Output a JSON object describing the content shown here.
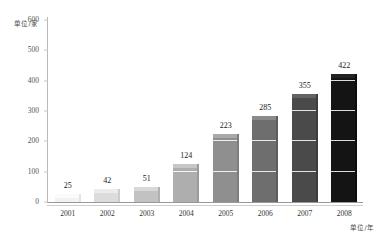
{
  "chart_data": {
    "type": "bar",
    "title": "",
    "subtitle": "",
    "xlabel": "单位/年",
    "ylabel": "单位/家",
    "categories": [
      "2001",
      "2002",
      "2003",
      "2004",
      "2005",
      "2006",
      "2007",
      "2008"
    ],
    "values": [
      25,
      42,
      51,
      124,
      223,
      285,
      355,
      422
    ],
    "value_labels": [
      "25",
      "42",
      "51",
      "124",
      "223",
      "285",
      "355",
      "422"
    ],
    "ylim": [
      0,
      600
    ],
    "yticks": [
      0,
      100,
      200,
      300,
      400,
      500,
      600
    ],
    "ytick_labels": [
      "0",
      "100",
      "200",
      "300",
      "400",
      "500",
      "600"
    ],
    "grid": false,
    "legend": false,
    "legend_position": "none",
    "style": "3d-stacked-blocks",
    "bar_colors": [
      "#f2f2f2",
      "#dcdcdc",
      "#c2c2c2",
      "#aeaeae",
      "#8f8f8f",
      "#6e6e6e",
      "#4a4a4a",
      "#141414"
    ],
    "bar_top_colors": [
      "#fbfbfb",
      "#ececec",
      "#d8d8d8",
      "#c6c6c6",
      "#a9a9a9",
      "#8a8a8a",
      "#636363",
      "#232323"
    ],
    "bar_side_colors": [
      "#e4e4e4",
      "#cccccc",
      "#b0b0b0",
      "#9b9b9b",
      "#7d7d7d",
      "#5e5e5e",
      "#3d3d3d",
      "#0d0d0d"
    ]
  }
}
